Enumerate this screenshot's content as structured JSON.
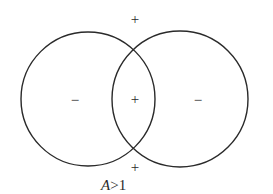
{
  "diagram": {
    "circles": [
      {
        "name": "left",
        "cx": 88,
        "cy": 99,
        "r": 67
      },
      {
        "name": "right",
        "cx": 180,
        "cy": 99,
        "r": 68
      }
    ],
    "stroke_color": "#2a2a2a",
    "signs": {
      "top": "+",
      "left": "−",
      "center": "+",
      "right": "−",
      "bottom": "+"
    },
    "caption": {
      "variable": "A",
      "relation": ">1"
    }
  }
}
